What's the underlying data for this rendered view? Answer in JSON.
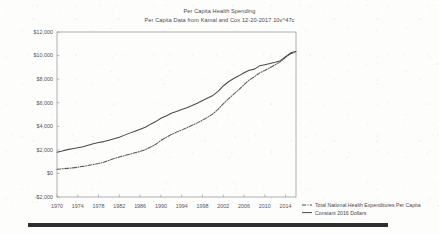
{
  "chart_data": {
    "type": "line",
    "title": "Per Capita Health Spending",
    "subtitle": "Per Capita Data from Kamal and Cox  12-20-2017 10v^47c",
    "xlabel": "",
    "ylabel": "",
    "xlim": [
      1970,
      2016
    ],
    "ylim": [
      -2000,
      12000
    ],
    "grid": false,
    "legend_position": "bottom-right",
    "xticks": [
      1970,
      1974,
      1978,
      1982,
      1986,
      1990,
      1994,
      1998,
      2002,
      2006,
      2010,
      2014
    ],
    "xtick_labels": [
      "1970",
      "1974",
      "1978",
      "1982",
      "1986",
      "1990",
      "1994",
      "1998",
      "2002",
      "2006",
      "2010",
      "2014"
    ],
    "yticks": [
      -2000,
      0,
      2000,
      4000,
      6000,
      8000,
      10000,
      12000
    ],
    "ytick_labels": [
      "-$2,000",
      "$0",
      "$2,000",
      "$4,000",
      "$6,000",
      "$8,000",
      "$10,000",
      "$12,000"
    ],
    "x": [
      1970,
      1971,
      1972,
      1973,
      1974,
      1975,
      1976,
      1977,
      1978,
      1979,
      1980,
      1981,
      1982,
      1983,
      1984,
      1985,
      1986,
      1987,
      1988,
      1989,
      1990,
      1991,
      1992,
      1993,
      1994,
      1995,
      1996,
      1997,
      1998,
      1999,
      2000,
      2001,
      2002,
      2003,
      2004,
      2005,
      2006,
      2007,
      2008,
      2009,
      2010,
      2011,
      2012,
      2013,
      2014,
      2015,
      2016
    ],
    "series": [
      {
        "name": "Total National Health Expenditures Per Capita",
        "style": "dash-dot",
        "color": "#5a5a5f",
        "values": [
          355,
          388,
          428,
          471,
          527,
          600,
          678,
          760,
          846,
          950,
          1108,
          1264,
          1392,
          1510,
          1628,
          1756,
          1868,
          2015,
          2236,
          2470,
          2806,
          3054,
          3301,
          3504,
          3683,
          3881,
          4083,
          4288,
          4519,
          4764,
          5048,
          5438,
          5910,
          6324,
          6720,
          7104,
          7527,
          7931,
          8200,
          8535,
          8737,
          8971,
          9222,
          9468,
          9846,
          10154,
          10348
        ]
      },
      {
        "name": "Constant 2016 Dollars",
        "style": "solid",
        "color": "#4a4a4f",
        "values": [
          1800,
          1905,
          2020,
          2100,
          2180,
          2260,
          2400,
          2520,
          2620,
          2700,
          2820,
          2940,
          3070,
          3250,
          3420,
          3580,
          3750,
          3920,
          4180,
          4400,
          4680,
          4880,
          5100,
          5260,
          5420,
          5580,
          5760,
          5960,
          6180,
          6400,
          6620,
          6960,
          7420,
          7780,
          8060,
          8280,
          8540,
          8760,
          8850,
          9130,
          9230,
          9330,
          9440,
          9570,
          9900,
          10230,
          10348
        ]
      }
    ]
  },
  "legend": {
    "items": [
      {
        "label": "Total National Health Expenditures Per Capita",
        "style": "dash-dot"
      },
      {
        "label": "Constant 2016 Dollars",
        "style": "solid"
      }
    ]
  }
}
